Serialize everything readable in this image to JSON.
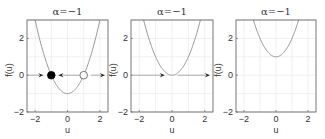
{
  "chart_data": [
    {
      "type": "line",
      "title": "α=−1",
      "xlabel": "u",
      "ylabel": "f(u)",
      "xlim": [
        -2.5,
        2.5
      ],
      "ylim": [
        -2,
        3
      ],
      "xticks": [
        -2,
        0,
        2
      ],
      "yticks": [
        -2,
        0,
        2
      ],
      "grid": true,
      "curve": {
        "formula": "u^2 - 1",
        "offset": -1
      },
      "fixed_points": [
        {
          "u": -1,
          "stability": "stable",
          "marker": "filled"
        },
        {
          "u": 1,
          "stability": "unstable",
          "marker": "open"
        }
      ],
      "flow_arrows": [
        {
          "from": -2.4,
          "to": -1.5,
          "direction": "right"
        },
        {
          "from": 0.75,
          "to": -0.55,
          "direction": "left"
        },
        {
          "from": 1.45,
          "to": 2.3,
          "direction": "right"
        }
      ]
    },
    {
      "type": "line",
      "title": "α=−1",
      "xlabel": "u",
      "ylabel": "f(u)",
      "xlim": [
        -2.5,
        2.5
      ],
      "ylim": [
        -2,
        3
      ],
      "xticks": [
        -2,
        0,
        2
      ],
      "yticks": [
        -2,
        0,
        2
      ],
      "grid": true,
      "curve": {
        "formula": "u^2",
        "offset": 0
      },
      "fixed_points": [],
      "flow_arrows": [
        {
          "from": -2.4,
          "to": -0.45,
          "direction": "right"
        },
        {
          "from": 0.35,
          "to": 2.3,
          "direction": "right"
        }
      ]
    },
    {
      "type": "line",
      "title": "α=−1",
      "xlabel": "u",
      "ylabel": "f(u)",
      "xlim": [
        -2.5,
        2.5
      ],
      "ylim": [
        -2,
        3
      ],
      "xticks": [
        -2,
        0,
        2
      ],
      "yticks": [
        -2,
        0,
        2
      ],
      "grid": true,
      "curve": {
        "formula": "u^2 + 1",
        "offset": 1
      },
      "fixed_points": [],
      "flow_arrows": []
    }
  ],
  "style": {
    "axis_color": "#555555",
    "grid_color": "#e6e6e6",
    "curve_color": "#8a8a8a",
    "arrow_shaft_color": "#9a9a9a",
    "arrow_head_color": "#222222",
    "marker_color": "#000000"
  },
  "layout": {
    "panels": [
      {
        "left": 27,
        "right": 108
      },
      {
        "left": 131,
        "right": 213
      },
      {
        "left": 236,
        "right": 316
      }
    ],
    "top": 20,
    "bottom": 112
  }
}
